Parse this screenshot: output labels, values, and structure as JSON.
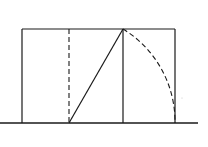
{
  "diagram": {
    "title": "",
    "type": "golden-rectangle-construction",
    "colors": {
      "stroke": "#1a1a1a",
      "background": "#ffffff"
    },
    "baseline": {
      "x1": 0,
      "x2": 198,
      "y": 123
    },
    "rectangle": {
      "left": 22,
      "top": 29,
      "right": 175,
      "bottom": 123
    },
    "square_right_edge_x": 123,
    "midpoint_dashed_x": 69,
    "diagonal": {
      "x1": 69,
      "y1": 123,
      "x2": 123,
      "y2": 29
    },
    "arc": {
      "cx": 69,
      "cy": 123,
      "from": [
        123,
        29
      ],
      "to": [
        175,
        123
      ]
    }
  }
}
